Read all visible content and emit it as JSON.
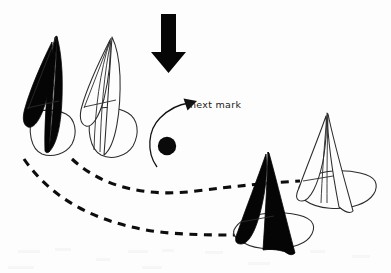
{
  "diagram": {
    "background_color": "#fdfdfd",
    "ink_color": "#0a0a0a",
    "labels": {
      "next_mark": "next mark"
    },
    "wind_arrow": {
      "name": "wind-direction-arrow",
      "direction": "down",
      "color": "#060606",
      "x": 168,
      "y_top": 14,
      "y_tip": 72
    },
    "mark_buoy": {
      "name": "racing-mark-buoy",
      "color": "#0a0a0a",
      "cx": 167,
      "cy": 146,
      "r": 9
    },
    "curved_pointer": {
      "name": "rounding-direction-arrow",
      "from": "below-left-of-mark",
      "to": "next-mark-label",
      "color": "#111111"
    },
    "tracks": [
      {
        "name": "inside-boat-track",
        "style": "dashed",
        "color": "#0d0d0d",
        "description": "upper dashed path from lead white boat around the mark to the right-hand white boat"
      },
      {
        "name": "outside-boat-track",
        "style": "dashed",
        "color": "#0d0d0d",
        "description": "lower dashed path from the left black boat swinging wide to the right-hand black boat"
      }
    ],
    "boats": [
      {
        "name": "boat-black-upwind-left",
        "sail_fill": "black",
        "hull_fill": "white",
        "position": "far-left",
        "heading": "down-right"
      },
      {
        "name": "boat-white-upwind-left",
        "sail_fill": "white",
        "hull_fill": "white",
        "position": "left-center",
        "heading": "down-right"
      },
      {
        "name": "boat-black-rounding-right",
        "sail_fill": "black",
        "hull_fill": "white",
        "position": "bottom-right",
        "heading": "right"
      },
      {
        "name": "boat-white-rounding-right",
        "sail_fill": "white",
        "hull_fill": "white",
        "position": "far-right",
        "heading": "right"
      }
    ]
  }
}
